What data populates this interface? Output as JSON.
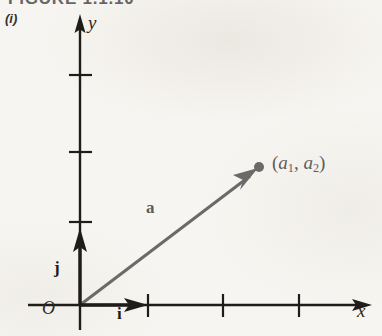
{
  "figure": {
    "title": "FIGURE 1.1.10",
    "part_label": "(i)"
  },
  "axes": {
    "x_label": "x",
    "y_label": "y",
    "origin_label": "O",
    "x_ticks": [
      1,
      2,
      3
    ],
    "y_ticks": [
      1,
      2,
      3
    ]
  },
  "vectors": {
    "position_vector_label": "a",
    "unit_i_label": "i",
    "unit_j_label": "j"
  },
  "point": {
    "open_paren": "(",
    "comp1_base": "a",
    "comp1_sub": "1",
    "comma": ", ",
    "comp2_base": "a",
    "comp2_sub": "2",
    "close_paren": ")"
  },
  "colors": {
    "axis": "#1f1d1a",
    "vector_gray": "#6b6a68",
    "unit_vector": "#1f1d1a",
    "background": "#f7f5f1"
  }
}
